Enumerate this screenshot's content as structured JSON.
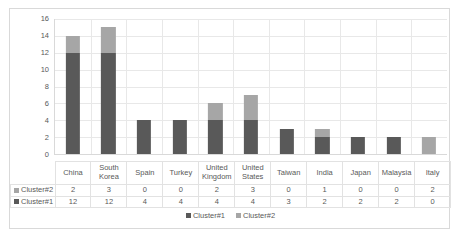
{
  "chart_data": {
    "type": "bar",
    "subtype": "stacked-column",
    "title": "",
    "xlabel": "",
    "ylabel": "",
    "ylim": [
      0,
      16
    ],
    "ytick_step": 2,
    "yticks": [
      16,
      14,
      12,
      10,
      8,
      6,
      4,
      2,
      0
    ],
    "grid": true,
    "legend_position": "bottom",
    "categories": [
      "China",
      "South Korea",
      "Spain",
      "Turkey",
      "United Kingdom",
      "United States",
      "Taiwan",
      "India",
      "Japan",
      "Malaysia",
      "Italy"
    ],
    "series": [
      {
        "name": "Cluster#1",
        "color": "#595959",
        "values": [
          12,
          12,
          4,
          4,
          4,
          4,
          3,
          2,
          2,
          2,
          0
        ]
      },
      {
        "name": "Cluster#2",
        "color": "#a6a6a6",
        "values": [
          2,
          3,
          0,
          0,
          2,
          3,
          0,
          1,
          0,
          0,
          2
        ]
      }
    ],
    "totals": [
      14,
      15,
      4,
      4,
      6,
      7,
      3,
      3,
      2,
      2,
      2
    ]
  },
  "table": {
    "row_order": [
      "Cluster#2",
      "Cluster#1"
    ]
  },
  "legend": {
    "entries": [
      "Cluster#1",
      "Cluster#2"
    ]
  },
  "colors": {
    "cluster1": "#595959",
    "cluster2": "#a6a6a6",
    "grid": "#e8e8e8",
    "border": "#d9d9d9",
    "text": "#595959",
    "background": "#ffffff"
  }
}
